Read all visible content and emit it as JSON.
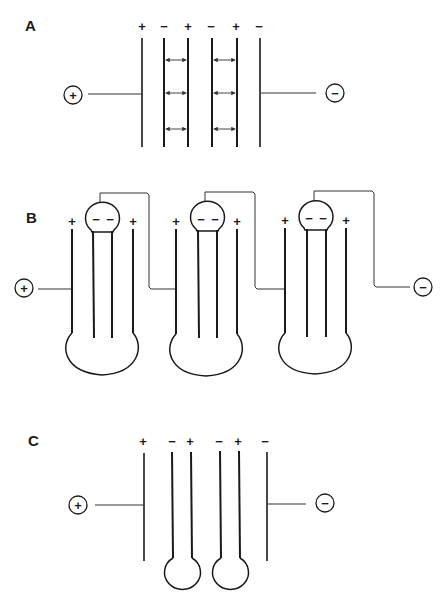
{
  "diagram": {
    "panels": [
      {
        "label": "A",
        "electrode_signs": [
          "+",
          "−",
          "+",
          "−",
          "+",
          "−"
        ],
        "positive_terminal": "+",
        "negative_terminal": "−",
        "description": "Six parallel plates with double-headed field arrows between inner plate pairs"
      },
      {
        "label": "B",
        "cells": [
          {
            "signs": [
              "+",
              "−",
              "−",
              "+"
            ]
          },
          {
            "signs": [
              "+",
              "−",
              "−",
              "+"
            ]
          },
          {
            "signs": [
              "+",
              "−",
              "−",
              "+"
            ]
          }
        ],
        "positive_terminal": "+",
        "negative_terminal": "−",
        "description": "Three folded bipolar cells connected in series"
      },
      {
        "label": "C",
        "electrode_signs": [
          "+",
          "−",
          "+",
          "−",
          "+",
          "−"
        ],
        "positive_terminal": "+",
        "negative_terminal": "−",
        "description": "Six plates with inner pairs joined by loops at bottom"
      }
    ]
  }
}
